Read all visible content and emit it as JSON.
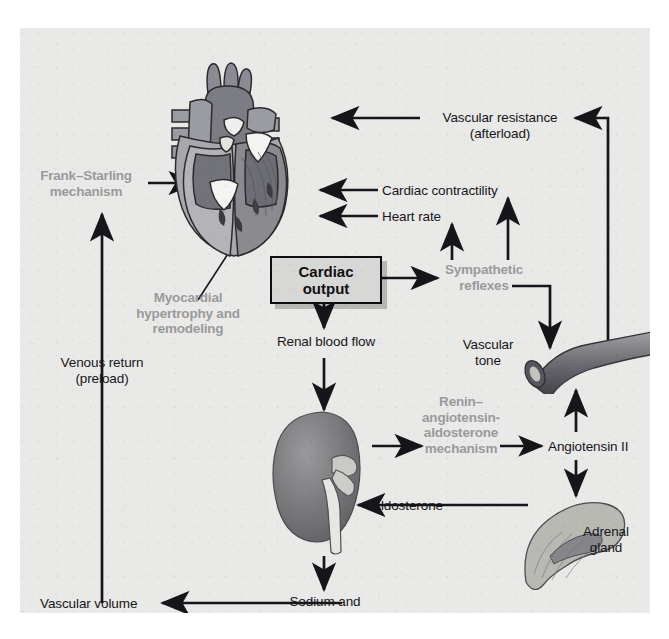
{
  "figure": {
    "type": "physiology-flow-diagram",
    "background_color": "#e9e9e7",
    "ink_color": "#16161a",
    "accent_gray": "#9a9a9c"
  },
  "central_node": {
    "line1": "Cardiac",
    "line2": "output",
    "fill": "#d7d7d5",
    "border": "#0e0e10"
  },
  "labels": {
    "frank_starling": {
      "line1": "Frank–Starling",
      "line2": "mechanism",
      "style": "gray"
    },
    "myocardial": {
      "line1": "Myocardial",
      "line2": "hypertrophy and",
      "line3": "remodeling",
      "style": "gray"
    },
    "sympathetic": {
      "line1": "Sympathetic",
      "line2": "reflexes",
      "style": "gray"
    },
    "renin": {
      "line1": "Renin–",
      "line2": "angiotensin-",
      "line3": "aldosterone",
      "line4": "mechanism",
      "style": "gray"
    },
    "vascular_resistance": {
      "line1": "Vascular resistance",
      "line2": "(afterload)",
      "style": "black"
    },
    "cardiac_contractility": {
      "line1": "Cardiac contractility",
      "style": "black"
    },
    "heart_rate": {
      "line1": "Heart rate",
      "style": "black"
    },
    "renal_blood_flow": {
      "line1": "Renal blood flow",
      "style": "black"
    },
    "venous_return": {
      "line1": "Venous return",
      "line2": "(preload)",
      "style": "black"
    },
    "vascular_tone": {
      "line1": "Vascular",
      "line2": "tone",
      "style": "black"
    },
    "angiotensin_ii": {
      "line1": "Angiotensin II",
      "style": "black"
    },
    "aldosterone": {
      "line1": "Aldosterone",
      "style": "black"
    },
    "adrenal_gland": {
      "line1": "Adrenal",
      "line2": "gland",
      "style": "black"
    },
    "vascular_volume": {
      "line1": "Vascular volume",
      "style": "black"
    },
    "sodium_water": {
      "line1": "Sodium and",
      "line2": "water retention",
      "style": "black"
    }
  },
  "organs": {
    "heart": "heart-cross-section-illustration",
    "kidney": "kidney-illustration",
    "blood_vessel": "blood-vessel-illustration",
    "adrenal": "adrenal-gland-illustration"
  }
}
